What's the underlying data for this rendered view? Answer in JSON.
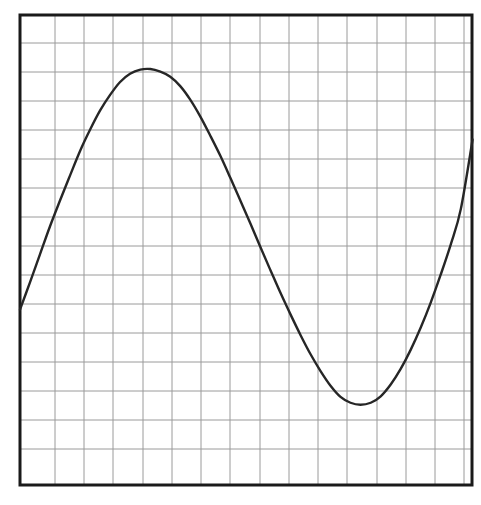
{
  "document": {
    "kind": "scanned-graph-figure",
    "background_color": "#ffffff"
  },
  "figure": {
    "name": "waveform-plot",
    "caption": "",
    "border_color": "#1a1a1a",
    "border_width_px": 3,
    "plot_area": {
      "left_px": 20,
      "top_px": 15,
      "right_px": 472,
      "bottom_px": 485,
      "width_px": 452,
      "height_px": 470
    },
    "grid": {
      "visible": true,
      "color": "#9a9a9a",
      "line_width_px": 1,
      "cell_size_px": 29.3,
      "vertical_line_count": 15,
      "horizontal_line_count": 15,
      "vertical_positions_px": [
        55,
        84,
        113,
        143,
        172,
        201,
        230,
        260,
        289,
        318,
        347,
        377,
        406,
        435,
        464
      ],
      "horizontal_positions_px": [
        43,
        72,
        101,
        130,
        159,
        188,
        217,
        246,
        275,
        304,
        333,
        362,
        391,
        420,
        449
      ]
    },
    "curve": {
      "color": "#262626",
      "line_width_px": 2.4,
      "style": "solid",
      "smoothing": "hand-drawn"
    }
  },
  "chart_data": {
    "type": "line",
    "title": "",
    "subtitle": "",
    "xlabel": "",
    "ylabel": "",
    "grid": true,
    "legend": null,
    "legend_position": "none",
    "axis_tick_labels_visible": false,
    "xlim": [
      0,
      15.4
    ],
    "ylim": [
      0,
      16.0
    ],
    "x_unit": "grid cells",
    "y_unit": "grid cells",
    "annotations": [
      {
        "label": "start",
        "x": 0.0,
        "y": 5.97
      },
      {
        "label": "crest",
        "x": 4.23,
        "y": 14.16
      },
      {
        "label": "trough",
        "x": 10.85,
        "y": 2.73
      },
      {
        "label": "end",
        "x": 15.42,
        "y": 11.76
      }
    ],
    "series": [
      {
        "name": "waveform",
        "color": "#262626",
        "x": [
          0.0,
          0.34,
          0.68,
          1.02,
          1.37,
          1.71,
          2.05,
          2.39,
          2.73,
          3.07,
          3.41,
          3.75,
          4.1,
          4.44,
          4.78,
          5.12,
          5.46,
          5.8,
          6.14,
          6.48,
          6.83,
          7.17,
          7.51,
          7.85,
          8.19,
          8.53,
          8.87,
          9.22,
          9.56,
          9.9,
          10.24,
          10.58,
          10.92,
          11.26,
          11.6,
          11.95,
          12.29,
          12.63,
          12.97,
          13.31,
          13.65,
          13.99,
          14.33,
          14.68,
          15.02,
          15.42
        ],
        "y": [
          5.97,
          6.9,
          7.85,
          8.8,
          9.7,
          10.55,
          11.38,
          12.1,
          12.75,
          13.28,
          13.72,
          14.0,
          14.14,
          14.16,
          14.07,
          13.9,
          13.58,
          13.12,
          12.55,
          11.9,
          11.2,
          10.45,
          9.68,
          8.9,
          8.1,
          7.32,
          6.55,
          5.8,
          5.1,
          4.45,
          3.88,
          3.38,
          3.0,
          2.8,
          2.73,
          2.8,
          3.02,
          3.42,
          3.95,
          4.6,
          5.35,
          6.2,
          7.15,
          8.2,
          9.4,
          11.76
        ]
      }
    ]
  }
}
